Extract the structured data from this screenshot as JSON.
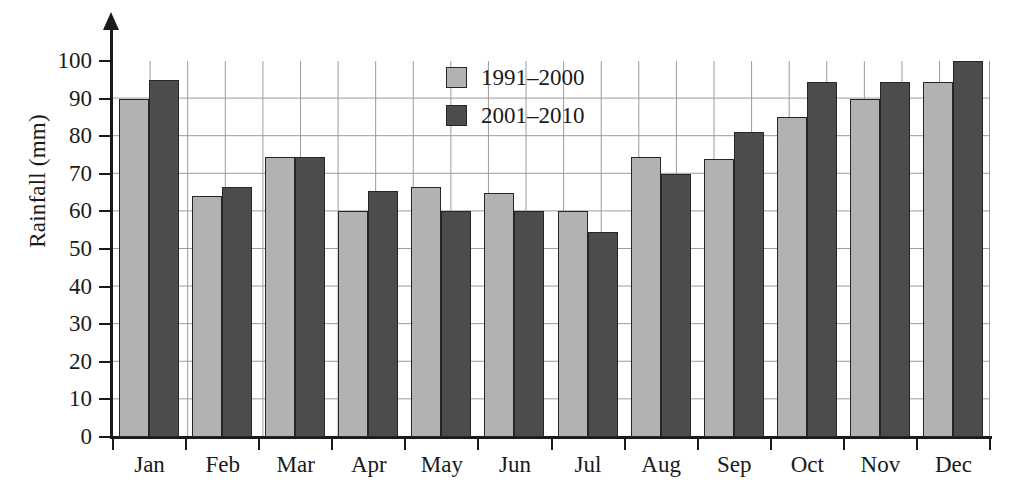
{
  "chart_data": {
    "type": "bar",
    "title": "",
    "xlabel": "",
    "ylabel": "Rainfall (mm)",
    "ylim": [
      0,
      100
    ],
    "ytick_step": 10,
    "yticks": [
      0,
      10,
      20,
      30,
      40,
      50,
      60,
      70,
      80,
      90,
      100
    ],
    "categories": [
      "Jan",
      "Feb",
      "Mar",
      "Apr",
      "May",
      "Jun",
      "Jul",
      "Aug",
      "Sep",
      "Oct",
      "Nov",
      "Dec"
    ],
    "grid": true,
    "legend_position": "top-center",
    "series": [
      {
        "name": "1991–2000",
        "color": "#b2b2b2",
        "values": [
          90,
          64,
          74.5,
          60,
          66.5,
          65,
          60,
          74.5,
          74,
          85,
          90,
          94.5
        ]
      },
      {
        "name": "2001–2010",
        "color": "#4c4c4c",
        "values": [
          95,
          66.5,
          74.5,
          65.5,
          60,
          60,
          54.5,
          70,
          81,
          94.5,
          94.5,
          100
        ]
      }
    ]
  },
  "axis": {
    "y_title": "Rainfall (mm)"
  },
  "colors": {
    "series_light": "#b2b2b2",
    "series_dark": "#4c4c4c",
    "grid": "#9a9a9a",
    "axis": "#1a1a1a"
  }
}
